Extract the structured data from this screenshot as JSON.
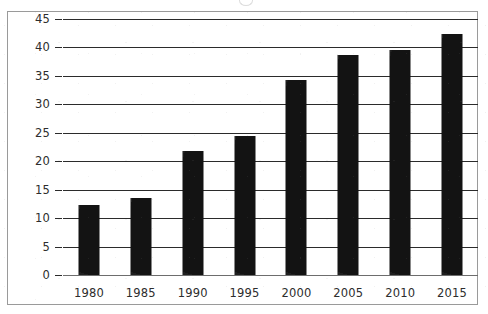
{
  "chart_data": {
    "type": "bar",
    "title": "",
    "xlabel": "",
    "ylabel": "",
    "categories": [
      "1980",
      "1985",
      "1990",
      "1995",
      "2000",
      "2005",
      "2010",
      "2015"
    ],
    "values": [
      12.3,
      13.5,
      21.8,
      24.4,
      34.3,
      38.6,
      39.6,
      42.3
    ],
    "series": [
      {
        "name": "",
        "values": [
          12.3,
          13.5,
          21.8,
          24.4,
          34.3,
          38.6,
          39.6,
          42.3
        ]
      }
    ],
    "ylim": [
      0,
      45
    ],
    "ytick_labels": [
      "0",
      "5",
      "10",
      "15",
      "20",
      "25",
      "30",
      "35",
      "40",
      "45"
    ],
    "ytick_values": [
      0,
      5,
      10,
      15,
      20,
      25,
      30,
      35,
      40,
      45
    ],
    "xtick_labels": [
      "1980",
      "1985",
      "1990",
      "1995",
      "2000",
      "2005",
      "2010",
      "2015"
    ],
    "grid": true,
    "grid_orientation": "horizontal",
    "legend": false,
    "legend_position": "none",
    "bar_color": "#131313",
    "gridline_color": "#2b2b2b",
    "axis_color": "#6d6d6d",
    "frame_color": "#9a9a9a",
    "background_color": "#ffffff",
    "text_color": "#2d2d2d",
    "annotations": []
  }
}
